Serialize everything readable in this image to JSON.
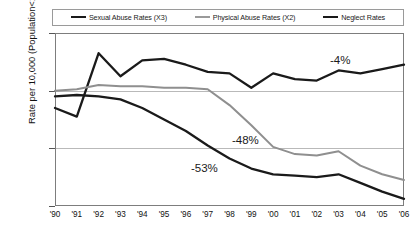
{
  "chart_data": {
    "type": "line",
    "title": "",
    "xlabel": "",
    "ylabel": "Rate per 10,000 (Population<18yrs)",
    "x": [
      "'90",
      "'91",
      "'92",
      "'93",
      "'94",
      "'95",
      "'96",
      "'97",
      "'98",
      "'99",
      "'00",
      "'01",
      "'02",
      "'03",
      "'04",
      "'05",
      "'06"
    ],
    "xlim": [
      0,
      16
    ],
    "ylim": [
      30,
      90
    ],
    "yticks": [
      30,
      50,
      70,
      90
    ],
    "grid": true,
    "legend_position": "top",
    "series": [
      {
        "name": "Sexual Abuse Rates (X3)",
        "color": "#1a1a1a",
        "width": 2.3,
        "values": [
          64.0,
          61.0,
          83.0,
          75.0,
          80.5,
          81.0,
          79.0,
          76.5,
          76.0,
          71.0,
          76.0,
          74.0,
          73.5,
          77.0,
          76.0,
          77.5,
          79.0
        ]
      },
      {
        "name": "Physical Abuse Rates (X2)",
        "color": "#8f8f8f",
        "width": 2.0,
        "values": [
          70.0,
          70.5,
          72.0,
          71.5,
          71.5,
          71.0,
          71.0,
          70.5,
          65.0,
          58.0,
          50.5,
          48.0,
          47.5,
          49.0,
          44.0,
          41.0,
          39.0
        ]
      },
      {
        "name": "Neglect Rates",
        "color": "#1a1a1a",
        "width": 2.3,
        "values": [
          68.0,
          68.5,
          68.0,
          67.0,
          64.0,
          60.0,
          56.0,
          51.0,
          46.5,
          43.0,
          41.0,
          40.5,
          40.0,
          41.0,
          38.0,
          35.0,
          32.5
        ]
      }
    ],
    "annotations": [
      {
        "text": "-4%",
        "series": "Sexual Abuse Rates (X3)",
        "x": 330,
        "y": 54
      },
      {
        "text": "-48%",
        "series": "Physical Abuse Rates (X2)",
        "x": 232,
        "y": 134
      },
      {
        "text": "-53%",
        "series": "Neglect Rates",
        "x": 191,
        "y": 162
      }
    ]
  },
  "legend": {
    "items": [
      {
        "label": "Sexual Abuse Rates (X3)",
        "color": "#1a1a1a",
        "width": 2.6
      },
      {
        "label": "Physical Abuse Rates (X2)",
        "color": "#9a9a9a",
        "width": 2.2
      },
      {
        "label": "Neglect Rates",
        "color": "#1a1a1a",
        "width": 2.6
      }
    ]
  },
  "axes": {
    "y_title": "Rate per 10,000 (Population<18yrs)",
    "y_tick_labels": [
      "90",
      "70",
      "50",
      "30"
    ],
    "x_tick_labels": [
      "'90",
      "'91",
      "'92",
      "'93",
      "'94",
      "'95",
      "'96",
      "'97",
      "'98",
      "'99",
      "'00",
      "'01",
      "'02",
      "'03",
      "'04",
      "'05",
      "'06"
    ]
  }
}
